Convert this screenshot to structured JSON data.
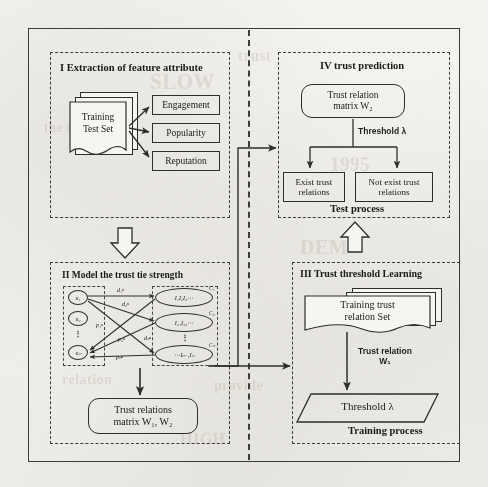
{
  "diagram": {
    "divider": "vertical-dashed-divider"
  },
  "ghost_text": [
    {
      "t": "SLOW",
      "x": 150,
      "y": 70,
      "s": 21
    },
    {
      "t": "trust",
      "x": 238,
      "y": 48,
      "s": 15
    },
    {
      "t": "1995",
      "x": 330,
      "y": 154,
      "s": 19
    },
    {
      "t": "the model of",
      "x": 44,
      "y": 120,
      "s": 13
    },
    {
      "t": "DEM",
      "x": 300,
      "y": 236,
      "s": 20
    },
    {
      "t": "relation",
      "x": 62,
      "y": 372,
      "s": 14
    },
    {
      "t": "provide",
      "x": 214,
      "y": 378,
      "s": 14
    },
    {
      "t": "HIGH",
      "x": 180,
      "y": 430,
      "s": 16
    }
  ],
  "panels": {
    "extraction": {
      "id": "I",
      "title": "I Extraction of feature attribute",
      "source_doc": {
        "line1": "Training",
        "line2": "Test Set"
      },
      "features": [
        {
          "label": "Engagement"
        },
        {
          "label": "Popularity"
        },
        {
          "label": "Reputation"
        }
      ]
    },
    "model": {
      "id": "II",
      "title": "II Model the trust tie strength",
      "users": [
        {
          "label": "u₁"
        },
        {
          "label": "u₂"
        },
        {
          "label": "uₙ"
        }
      ],
      "user_ellipsis": "⋮",
      "items": [
        {
          "label": "I₁I₂I₃⋯"
        },
        {
          "label": "I₂₁I₂₂⋯"
        },
        {
          "label": "⋯Iₙ₋₁Iₙ"
        }
      ],
      "item_ellipsis": "⋮",
      "item_tags": [
        {
          "label": "C₁"
        },
        {
          "label": "C₂"
        },
        {
          "label": "Cₙ"
        }
      ],
      "edge_labels": [
        {
          "label": "d₁ⁿ"
        },
        {
          "label": "d₂ⁿ"
        },
        {
          "label": "dₙⁿ"
        },
        {
          "label": "p₁ⁿ"
        },
        {
          "label": "p₂ⁿ"
        },
        {
          "label": "pₙⁿ"
        }
      ],
      "output": {
        "line1": "Trust relations",
        "line2": "matrix W₁, W₂"
      }
    },
    "threshold": {
      "id": "III",
      "title": "III Trust threshold Learning",
      "source_doc": {
        "line1": "Training  trust",
        "line2": "relation Set"
      },
      "edge_label": {
        "line1": "Trust relation",
        "line2": "W₁"
      },
      "result": "Threshold  λ",
      "footer": "Training process"
    },
    "prediction": {
      "id": "IV",
      "title": "IV trust prediction",
      "input": {
        "line1": "Trust relation",
        "line2": "matrix W₂"
      },
      "edge_label": "Threshold λ",
      "outcomes": [
        {
          "line1": "Exist trust",
          "line2": "relations"
        },
        {
          "line1": "Not exist trust",
          "line2": "relations"
        }
      ],
      "footer": "Test process"
    }
  },
  "connectors": {
    "i_to_ii": "hollow-down-arrow",
    "iii_to_iv": "hollow-up-arrow",
    "ii_to_iv": "line-arrow-right",
    "ii_to_iii": "line-arrow-right"
  },
  "colors": {
    "ink": "#2e2e2c",
    "paper": "#f4f3ef",
    "ghost": "#b9b4aa"
  }
}
